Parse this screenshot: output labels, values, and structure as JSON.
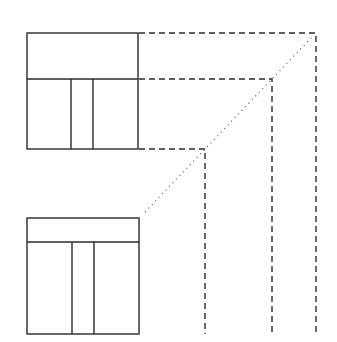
{
  "diagram": {
    "type": "orthographic-projection",
    "stroke_color": "#2a2a2a",
    "background": "#ffffff",
    "top_view": {
      "x": 27,
      "y": 33,
      "width": 111,
      "height": 116,
      "divider_y": 79,
      "vertical_dividers_x": [
        71,
        93
      ]
    },
    "front_view": {
      "x": 27,
      "y": 218,
      "width": 112,
      "height": 116,
      "divider_y": 242,
      "vertical_dividers_x": [
        72,
        94
      ]
    },
    "projection_lines": [
      {
        "from_y": 33,
        "corner_x": 316,
        "to_y": 334
      },
      {
        "from_y": 79,
        "corner_x": 272,
        "to_y": 334
      },
      {
        "from_y": 149,
        "corner_x": 205,
        "to_y": 334
      }
    ],
    "miter_line": {
      "x1": 145,
      "y1": 212,
      "x2": 312,
      "y2": 37
    }
  }
}
